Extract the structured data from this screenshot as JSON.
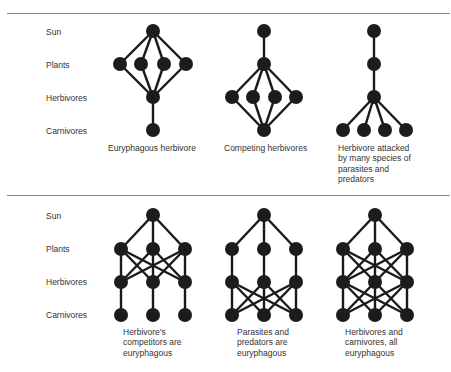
{
  "panels": [
    {
      "id": "top",
      "divider_y": 13,
      "row_labels": [
        "Sun",
        "Plants",
        "Herbivores",
        "Carnivores"
      ],
      "row_label_y": [
        27,
        60,
        93,
        126
      ],
      "row_y": [
        31,
        64,
        97,
        130
      ],
      "webs": [
        {
          "caption": [
            "Euryphagous herbivore"
          ],
          "caption_x": 108,
          "caption_y": 143,
          "nodes": {
            "sun": [
              [
                153,
                31
              ]
            ],
            "plants": [
              [
                120,
                64
              ],
              [
                141,
                64
              ],
              [
                164,
                64
              ],
              [
                186,
                64
              ]
            ],
            "herbivores": [
              [
                153,
                97
              ]
            ],
            "carnivores": [
              [
                153,
                130
              ]
            ]
          },
          "links": "sun-plants:all; plants-herbivores:all; herbivores-carnivores:all"
        },
        {
          "caption": [
            "Competing herbivores"
          ],
          "caption_x": 224,
          "caption_y": 143,
          "nodes": {
            "sun": [
              [
                264,
                31
              ]
            ],
            "plants": [
              [
                264,
                64
              ]
            ],
            "herbivores": [
              [
                232,
                97
              ],
              [
                253,
                97
              ],
              [
                275,
                97
              ],
              [
                296,
                97
              ]
            ],
            "carnivores": [
              [
                264,
                130
              ]
            ]
          },
          "links": "sun-plants:all; plants-herbivores:all; herbivores-carnivores:all"
        },
        {
          "caption": [
            "Herbivore attacked",
            "by many species of",
            "parasites and",
            "predators"
          ],
          "caption_x": 338,
          "caption_y": 143,
          "nodes": {
            "sun": [
              [
                374,
                31
              ]
            ],
            "plants": [
              [
                374,
                64
              ]
            ],
            "herbivores": [
              [
                374,
                97
              ]
            ],
            "carnivores": [
              [
                343,
                130
              ],
              [
                364,
                130
              ],
              [
                385,
                130
              ],
              [
                406,
                130
              ]
            ]
          },
          "links": "sun-plants:all; plants-herbivores:all; herbivores-carnivores:all"
        }
      ]
    },
    {
      "id": "bottom",
      "divider_y": 195,
      "row_labels": [
        "Sun",
        "Plants",
        "Herbivores",
        "Carnivores"
      ],
      "row_label_y": [
        211,
        244,
        277,
        310
      ],
      "row_y": [
        215,
        249,
        282,
        315
      ],
      "webs": [
        {
          "caption": [
            "Herbivore's",
            "competitors are",
            "euryphagous"
          ],
          "caption_x": 123,
          "caption_y": 327,
          "nodes": {
            "sun": [
              [
                153,
                215
              ]
            ],
            "plants": [
              [
                121,
                249
              ],
              [
                153,
                249
              ],
              [
                185,
                249
              ]
            ],
            "herbivores": [
              [
                121,
                282
              ],
              [
                153,
                282
              ],
              [
                185,
                282
              ]
            ],
            "carnivores": [
              [
                121,
                315
              ],
              [
                153,
                315
              ],
              [
                185,
                315
              ]
            ]
          },
          "links": "sun-plants:all; plants-herbivores:all; herbivores-carnivores:straight"
        },
        {
          "caption": [
            "Parasites and",
            "predators are",
            "euryphagous"
          ],
          "caption_x": 237,
          "caption_y": 327,
          "nodes": {
            "sun": [
              [
                264,
                215
              ]
            ],
            "plants": [
              [
                232,
                249
              ],
              [
                264,
                249
              ],
              [
                296,
                249
              ]
            ],
            "herbivores": [
              [
                232,
                282
              ],
              [
                264,
                282
              ],
              [
                296,
                282
              ]
            ],
            "carnivores": [
              [
                232,
                315
              ],
              [
                264,
                315
              ],
              [
                296,
                315
              ]
            ]
          },
          "links": "sun-plants:all; plants-herbivores:straight; herbivores-carnivores:all"
        },
        {
          "caption": [
            "Herbivores and",
            "carnivores, all",
            "euryphagous"
          ],
          "caption_x": 345,
          "caption_y": 327,
          "nodes": {
            "sun": [
              [
                375,
                215
              ]
            ],
            "plants": [
              [
                343,
                249
              ],
              [
                375,
                249
              ],
              [
                407,
                249
              ]
            ],
            "herbivores": [
              [
                343,
                282
              ],
              [
                375,
                282
              ],
              [
                407,
                282
              ]
            ],
            "carnivores": [
              [
                343,
                315
              ],
              [
                375,
                315
              ],
              [
                407,
                315
              ]
            ]
          },
          "links": "sun-plants:all; plants-herbivores:all; herbivores-carnivores:all"
        }
      ]
    }
  ]
}
